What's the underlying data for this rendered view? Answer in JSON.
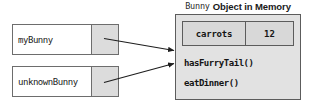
{
  "diagram": {
    "title": {
      "mono_part": "Bunny",
      "bold_part": "Object in Memory"
    },
    "variables": [
      {
        "name": "myBunny",
        "reference_cell": ""
      },
      {
        "name": "unknownBunny",
        "reference_cell": ""
      }
    ],
    "object": {
      "fields": [
        {
          "key": "carrots",
          "value": "12"
        }
      ],
      "methods": [
        "hasFurryTail()",
        "eatDinner()"
      ]
    },
    "arrows": [
      {
        "from": "myBunny-reference-cell",
        "to": "bunny-object"
      },
      {
        "from": "unknownBunny-reference-cell",
        "to": "bunny-object"
      }
    ],
    "colors": {
      "page_background": "#ffffff",
      "variable_box_fill": "#ffffff",
      "reference_cell_fill": "#dcdcdc",
      "object_box_fill": "#e2e2e2",
      "field_box_fill": "#d8d8d8",
      "border": "#5c5c5c",
      "text": "#151515",
      "arrow": "#1e1e1e"
    }
  }
}
